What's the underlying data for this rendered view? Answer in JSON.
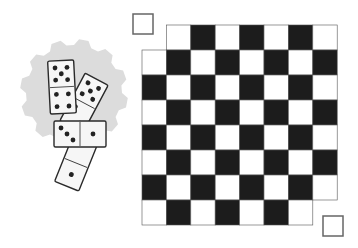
{
  "figure": {
    "colors": {
      "background": "#ffffff",
      "dark_square": "#1c1c1c",
      "light_square": "#ffffff",
      "grid_line": "#555555",
      "gear": "#dcdcdc",
      "domino_face": "#f6f6f6",
      "domino_outline": "#2a2a2a",
      "pip": "#222222",
      "removed_square_outline": "#666666"
    }
  },
  "board": {
    "rows": 8,
    "cols": 8,
    "x": 142,
    "y": 25,
    "cell_w": 24.4,
    "cell_h": 25,
    "top_left_dark": true,
    "removed_cells": [
      [
        0,
        0
      ],
      [
        7,
        7
      ]
    ]
  },
  "removed_squares": [
    {
      "name": "removed-square-top-left",
      "x": 133,
      "y": 14,
      "size": 20
    },
    {
      "name": "removed-square-bottom-right",
      "x": 323,
      "y": 216,
      "size": 20
    }
  ],
  "gear": {
    "cx": 74,
    "cy": 93,
    "r_outer": 54,
    "r_inner": 48,
    "teeth": 12
  },
  "dominoes": [
    {
      "name": "domino-4",
      "cx": 76,
      "cy": 163,
      "w": 26,
      "h": 50,
      "rot": 22,
      "top_pips": 0,
      "bottom_pips": 1
    },
    {
      "name": "domino-2",
      "cx": 84,
      "cy": 103,
      "w": 26,
      "h": 54,
      "rot": 28,
      "top_pips": 5,
      "bottom_pips": 2
    },
    {
      "name": "domino-1",
      "cx": 62,
      "cy": 87,
      "w": 26,
      "h": 53,
      "rot": -3,
      "top_pips": 5,
      "bottom_pips": 4
    },
    {
      "name": "domino-3",
      "cx": 80,
      "cy": 134,
      "w": 52,
      "h": 26,
      "rot": 0,
      "left_pips": 3,
      "right_pips": 1
    }
  ]
}
